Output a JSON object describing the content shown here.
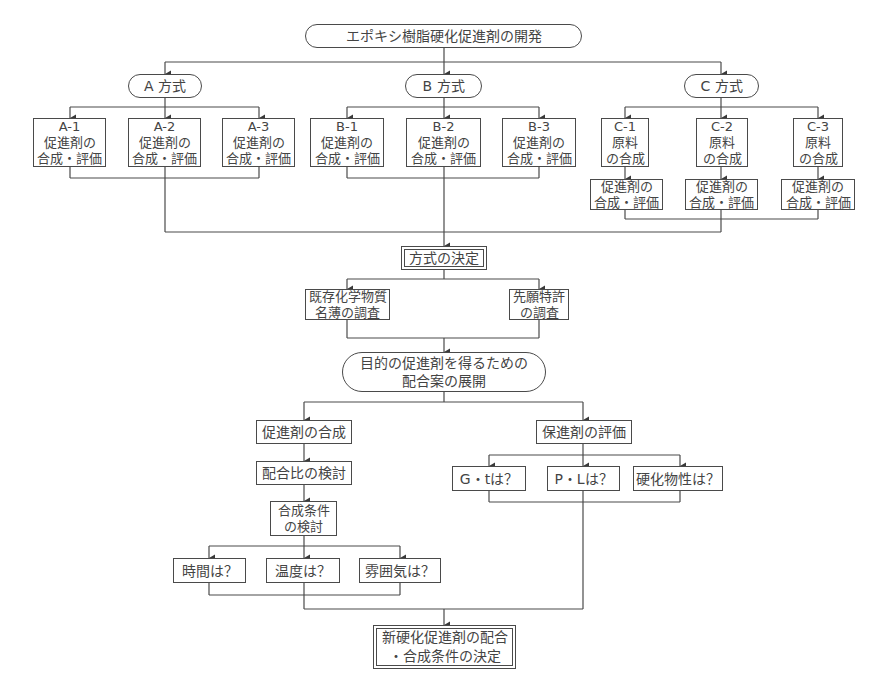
{
  "title": "エポキシ樹脂硬化促進剤の開発",
  "methods": {
    "a": {
      "label": "A 方式",
      "items": [
        {
          "label": "A-1\n促進剤の\n合成・評価"
        },
        {
          "label": "A-2\n促進剤の\n合成・評価"
        },
        {
          "label": "A-3\n促進剤の\n合成・評価"
        }
      ]
    },
    "b": {
      "label": "B 方式",
      "items": [
        {
          "label": "B-1\n促進剤の\n合成・評価"
        },
        {
          "label": "B-2\n促進剤の\n合成・評価"
        },
        {
          "label": "B-3\n促進剤の\n合成・評価"
        }
      ]
    },
    "c": {
      "label": "C 方式",
      "items": [
        {
          "label": "C-1\n原料\nの合成",
          "sub": "促進剤の\n合成・評価"
        },
        {
          "label": "C-2\n原料\nの合成",
          "sub": "促進剤の\n合成・評価"
        },
        {
          "label": "C-3\n原料\nの合成",
          "sub": "促進剤の\n合成・評価"
        }
      ]
    }
  },
  "decision": "方式の決定",
  "surveys": [
    {
      "label": "既存化学物質\n名薄の調査"
    },
    {
      "label": "先願特許\nの調査"
    }
  ],
  "development": "目的の促進剤を得るための\n配合案の展開",
  "synthesis": {
    "label": "促進剤の合成",
    "ratio": "配合比の検討",
    "conditions": "合成条件\nの検討",
    "questions": [
      "時間は？",
      "温度は？",
      "雰囲気は？"
    ]
  },
  "evaluation": {
    "label": "保進剤の評価",
    "questions": [
      "G・tは？",
      "P・Lは？",
      "硬化物性は？"
    ]
  },
  "final": "新硬化促進剤の配合\n・合成条件の決定"
}
